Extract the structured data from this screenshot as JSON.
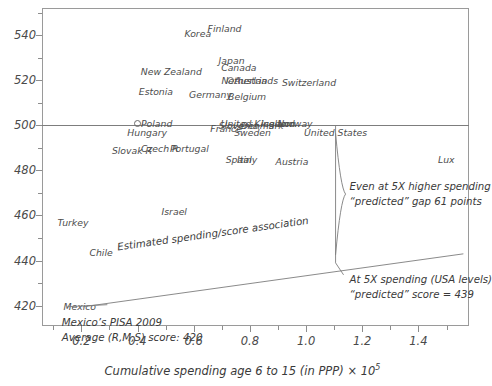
{
  "chart_data": {
    "type": "scatter",
    "title": "",
    "xlabel": "Cumulative spending age 6 to 15 (in PPP) × 10⁵",
    "ylabel": "",
    "xlim": [
      0.06,
      1.58
    ],
    "ylim": [
      411,
      552
    ],
    "grid": false,
    "legend": "none",
    "xticks": [
      "0.2",
      "0.4",
      "0.6",
      "0.8",
      "1.0",
      "1.2",
      "1.4"
    ],
    "xtick_values": [
      0.2,
      0.4,
      0.6,
      0.8,
      1.0,
      1.2,
      1.4
    ],
    "yticks": [
      "420",
      "440",
      "460",
      "480",
      "500",
      "520",
      "540"
    ],
    "ytick_values": [
      420,
      440,
      460,
      480,
      500,
      520,
      540
    ],
    "reference_line_y": 500,
    "points": [
      {
        "label": "Korea",
        "x": 0.615,
        "y": 541,
        "marker": false
      },
      {
        "label": "Finland",
        "x": 0.71,
        "y": 543,
        "marker": false
      },
      {
        "label": "Japan",
        "x": 0.735,
        "y": 529,
        "marker": false
      },
      {
        "label": "Canada",
        "x": 0.76,
        "y": 526,
        "marker": false
      },
      {
        "label": "New Zealand",
        "x": 0.52,
        "y": 524,
        "marker": false
      },
      {
        "label": "Austria",
        "x": 0.73,
        "y": 520,
        "marker": true
      },
      {
        "label": "Netherlands",
        "x": 0.8,
        "y": 520,
        "marker": false
      },
      {
        "label": "Switzerland",
        "x": 1.01,
        "y": 519,
        "marker": false
      },
      {
        "label": "Estonia",
        "x": 0.465,
        "y": 515,
        "marker": false
      },
      {
        "label": "Germany",
        "x": 0.66,
        "y": 514,
        "marker": false
      },
      {
        "label": "Belgium",
        "x": 0.79,
        "y": 513,
        "marker": false
      },
      {
        "label": "Poland",
        "x": 0.398,
        "y": 501,
        "marker": true
      },
      {
        "label": "France",
        "x": 0.716,
        "y": 499,
        "marker": false
      },
      {
        "label": "Slovenia",
        "x": 0.76,
        "y": 500,
        "marker": false
      },
      {
        "label": "Denmark",
        "x": 0.845,
        "y": 500,
        "marker": false
      },
      {
        "label": "United Kingdom",
        "x": 0.83,
        "y": 501,
        "marker": false
      },
      {
        "label": "Iceland",
        "x": 0.9,
        "y": 501,
        "marker": false
      },
      {
        "label": "Norway",
        "x": 0.96,
        "y": 501,
        "marker": false
      },
      {
        "label": "Sweden",
        "x": 0.81,
        "y": 497,
        "marker": false
      },
      {
        "label": "United States",
        "x": 1.105,
        "y": 497,
        "marker": false
      },
      {
        "label": "Hungary",
        "x": 0.435,
        "y": 497,
        "marker": false
      },
      {
        "label": "Czech R",
        "x": 0.48,
        "y": 490,
        "marker": false
      },
      {
        "label": "Slovak R",
        "x": 0.38,
        "y": 489,
        "marker": false
      },
      {
        "label": "Portugal",
        "x": 0.585,
        "y": 490,
        "marker": false
      },
      {
        "label": "Spain",
        "x": 0.76,
        "y": 485,
        "marker": false
      },
      {
        "label": "Italy",
        "x": 0.79,
        "y": 485,
        "marker": false
      },
      {
        "label": "Austria",
        "x": 0.95,
        "y": 484,
        "marker": false
      },
      {
        "label": "Lux",
        "x": 1.5,
        "y": 485,
        "marker": false
      },
      {
        "label": "Israel",
        "x": 0.53,
        "y": 462,
        "marker": false
      },
      {
        "label": "Turkey",
        "x": 0.17,
        "y": 457,
        "marker": false
      },
      {
        "label": "Chile",
        "x": 0.27,
        "y": 444,
        "marker": false
      },
      {
        "label": "Mexico",
        "x": 0.195,
        "y": 420,
        "marker": false
      }
    ],
    "fit_line": {
      "label": "Estimated spending/score association",
      "x1": 0.205,
      "y1": 419.5,
      "x2": 1.56,
      "y2": 443.0
    },
    "annotations": [
      {
        "name": "gap-annotation",
        "text_line1": "Even at 5X higher spending",
        "text_line2": "“predicted” gap 61 points"
      },
      {
        "name": "predicted-annotation",
        "text_line1": "At 5X spending (USA levels)",
        "text_line2": "“predicted” score = 439"
      },
      {
        "name": "mexico-annotation",
        "text_line1": "Mexico’s PISA 2009",
        "text_line2": "Average (R,M,S) score: 420"
      }
    ],
    "bracket": {
      "x": 1.105,
      "y_top": 500,
      "y_bottom": 439,
      "gap_points": 61
    }
  },
  "axes": {
    "x_title": "Cumulative spending age 6 to 15 (in PPP) × 10",
    "x_title_exponent": "5"
  },
  "colors": {
    "axis": "#8d8d8d",
    "frame": "#9a9a9a",
    "text": "#3a3a3a",
    "label": "#4d4d4d",
    "line": "#7d7d7d"
  }
}
